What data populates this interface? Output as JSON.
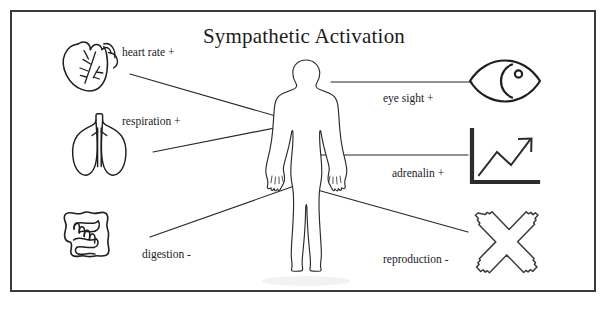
{
  "figure": {
    "title": "Sympathetic Activation",
    "border_color": "#3a3a3c",
    "ink_color": "#1b1b1d",
    "background": "#ffffff"
  },
  "central_subject": {
    "name": "human body silhouette",
    "icon": "human-body-outline"
  },
  "left_items": [
    {
      "id": "heart-rate",
      "label": "heart rate +",
      "icon": "heart-icon",
      "direction": "+",
      "organ": "heart"
    },
    {
      "id": "respiration",
      "label": "respiration +",
      "icon": "lungs-icon",
      "direction": "+",
      "organ": "lungs"
    },
    {
      "id": "digestion",
      "label": "digestion -",
      "icon": "intestines-icon",
      "direction": "-",
      "organ": "intestines"
    }
  ],
  "right_items": [
    {
      "id": "eye-sight",
      "label": "eye sight +",
      "icon": "eye-icon",
      "direction": "+",
      "organ": "eye"
    },
    {
      "id": "adrenalin",
      "label": "adrenalin +",
      "icon": "rising-chart-icon",
      "direction": "+",
      "organ": "adrenal output"
    },
    {
      "id": "reproduction",
      "label": "reproduction -",
      "icon": "cross-x-icon",
      "direction": "-",
      "organ": "reproductive system"
    }
  ]
}
